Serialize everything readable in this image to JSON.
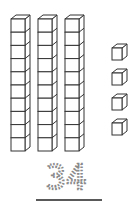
{
  "diagram": {
    "tens": {
      "count": 3,
      "cubes_per_rod": 10,
      "label": "tens rods"
    },
    "ones": {
      "count": 4,
      "label": "ones cubes"
    },
    "number": "34",
    "colors": {
      "stroke": "#333333",
      "fill": "#ffffff",
      "number": "#8a8a8a",
      "underline": "#222222"
    }
  }
}
